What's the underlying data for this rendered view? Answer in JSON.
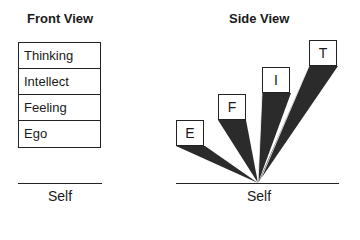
{
  "front_view": {
    "title": "Front View",
    "layers": [
      {
        "label": "Thinking"
      },
      {
        "label": "Intellect"
      },
      {
        "label": "Feeling"
      },
      {
        "label": "Ego"
      }
    ],
    "base_label": "Self"
  },
  "side_view": {
    "title": "Side View",
    "boxes": [
      {
        "label": "E"
      },
      {
        "label": "F"
      },
      {
        "label": "I"
      },
      {
        "label": "T"
      }
    ],
    "base_label": "Self"
  },
  "colors": {
    "wedge_fill": "#2b2b2b",
    "line": "#222222"
  }
}
